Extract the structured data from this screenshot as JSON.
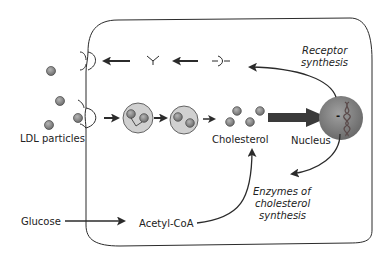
{
  "diagram": {
    "labels": {
      "ldl_particles": "LDL particles",
      "cholesterol": "Cholesterol",
      "nucleus": "Nucleus",
      "nucleus_sign": "-",
      "receptor_synthesis_line1": "Receptor",
      "receptor_synthesis_line2": "synthesis",
      "enzymes_line1": "Enzymes of",
      "enzymes_line2": "cholesterol",
      "enzymes_line3": "synthesis",
      "glucose": "Glucose",
      "acetyl_coa": "Acetyl-CoA"
    },
    "colors": {
      "stroke": "#2b2b2b",
      "particle_fill": "#8a8a8a",
      "particle_outline": "#444444",
      "vesicle_fill": "#d0d0d0",
      "nucleus_fill": "#8c8c8c",
      "arrow": "#2b2b2b"
    }
  }
}
